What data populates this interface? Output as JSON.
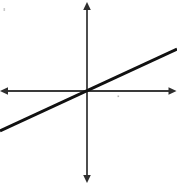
{
  "figure": {
    "title": "",
    "background_color": "#ffffff",
    "width": 177,
    "height": 186
  },
  "chart_data": {
    "type": "line",
    "title": "",
    "subtitle": "",
    "xlabel": "",
    "ylabel": "",
    "legend": [],
    "legend_position": "none",
    "grid": false,
    "axes": {
      "style": "cartesian-double-arrow",
      "origin_px": [
        87,
        91
      ],
      "x_axis": {
        "orientation": "horizontal",
        "y_px": 91,
        "start_px": 0,
        "end_px": 176,
        "arrow_start": true,
        "arrow_end": true,
        "tick_labels": [],
        "color": "#3a3a3a"
      },
      "y_axis": {
        "orientation": "vertical",
        "x_px": 87,
        "start_px": 2,
        "end_px": 183,
        "arrow_start": true,
        "arrow_end": true,
        "tick_labels": [],
        "color": "#3a3a3a"
      },
      "xlim": [
        -1,
        1
      ],
      "ylim": [
        -1,
        1
      ]
    },
    "series": [
      {
        "name": "line-through-origin",
        "type": "line",
        "color": "#111111",
        "line_width": 3,
        "through_origin": true,
        "slope": 0.46,
        "intercept": 0,
        "x": [
          -0.983,
          0.0,
          1.017
        ],
        "y": [
          -0.452,
          0.0,
          0.468
        ],
        "points_px": [
          [
            0,
            131
          ],
          [
            87,
            91
          ],
          [
            177,
            49
          ]
        ]
      }
    ],
    "annotations": [
      {
        "name": "speck-top-left",
        "x_px": 4,
        "y_px": 9,
        "color": "#c9c9c9"
      },
      {
        "name": "speck-below-x-axis",
        "x_px": 118,
        "y_px": 96,
        "color": "#b5b5b5"
      }
    ]
  }
}
